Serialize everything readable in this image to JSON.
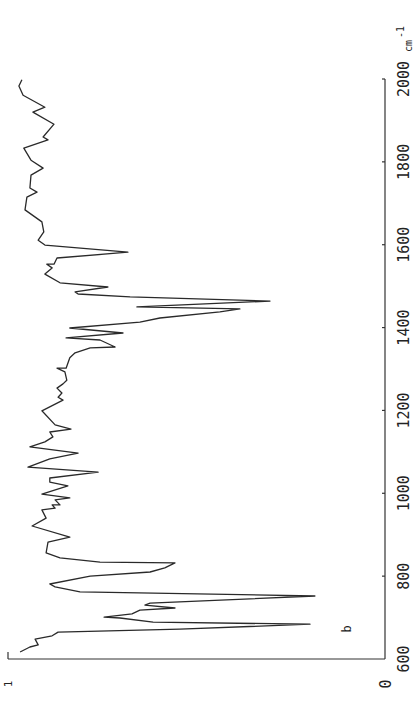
{
  "chart_data": {
    "type": "line",
    "title": "",
    "orientation": "rotated-90-ccw",
    "xlabel": "cm-1",
    "xlabel_superscript": "-1",
    "xlabel_base": "cm",
    "ylabel": "",
    "xlim": [
      600,
      2000
    ],
    "ylim": [
      0,
      1
    ],
    "x_ticks": [
      600,
      800,
      1000,
      1200,
      1400,
      1600,
      1800,
      2000
    ],
    "x_tick_labels": [
      "600",
      "800",
      "1000",
      "1200",
      "1400",
      "1600",
      "1800",
      "2000"
    ],
    "y_tick_labels": {
      "min": "0",
      "max": "1"
    },
    "annotation": "b",
    "grid": false,
    "legend": "none",
    "series": [
      {
        "name": "spectrum b",
        "x": [
          1998,
          1983,
          1961,
          1932,
          1920,
          1891,
          1860,
          1853,
          1833,
          1804,
          1785,
          1768,
          1737,
          1727,
          1715,
          1684,
          1655,
          1631,
          1611,
          1599,
          1582,
          1568,
          1553,
          1553,
          1544,
          1529,
          1508,
          1498,
          1486,
          1481,
          1474,
          1464,
          1450,
          1445,
          1438,
          1423,
          1413,
          1399,
          1387,
          1375,
          1370,
          1353,
          1351,
          1339,
          1327,
          1302,
          1302,
          1293,
          1273,
          1264,
          1254,
          1242,
          1232,
          1225,
          1199,
          1165,
          1155,
          1148,
          1136,
          1124,
          1112,
          1097,
          1083,
          1063,
          1051,
          1037,
          1027,
          1018,
          998,
          989,
          984,
          972,
          972,
          964,
          960,
          940,
          921,
          894,
          882,
          856,
          844,
          834,
          832,
          820,
          810,
          800,
          781,
          774,
          762,
          752,
          735,
          730,
          723,
          718,
          709,
          701,
          699,
          689,
          684,
          672,
          665,
          656,
          648,
          634,
          629,
          617
        ],
        "y": [
          0.963,
          0.971,
          0.96,
          0.902,
          0.934,
          0.878,
          0.907,
          0.894,
          0.958,
          0.939,
          0.907,
          0.939,
          0.942,
          0.923,
          0.95,
          0.955,
          0.91,
          0.905,
          0.92,
          0.902,
          0.682,
          0.87,
          0.878,
          0.897,
          0.883,
          0.902,
          0.862,
          0.735,
          0.822,
          0.814,
          0.676,
          0.305,
          0.658,
          0.385,
          0.438,
          0.597,
          0.65,
          0.836,
          0.695,
          0.846,
          0.756,
          0.716,
          0.782,
          0.822,
          0.836,
          0.846,
          0.87,
          0.849,
          0.844,
          0.854,
          0.87,
          0.857,
          0.867,
          0.854,
          0.91,
          0.875,
          0.833,
          0.889,
          0.881,
          0.902,
          0.942,
          0.814,
          0.889,
          0.947,
          0.761,
          0.889,
          0.889,
          0.841,
          0.91,
          0.836,
          0.875,
          0.862,
          0.883,
          0.875,
          0.91,
          0.899,
          0.936,
          0.836,
          0.894,
          0.899,
          0.862,
          0.756,
          0.557,
          0.584,
          0.623,
          0.782,
          0.889,
          0.875,
          0.809,
          0.186,
          0.623,
          0.637,
          0.557,
          0.65,
          0.671,
          0.745,
          0.703,
          0.615,
          0.199,
          0.544,
          0.867,
          0.883,
          0.928,
          0.92,
          0.942,
          0.968
        ]
      }
    ]
  }
}
